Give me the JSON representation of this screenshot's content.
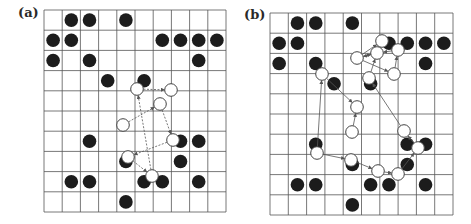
{
  "panels": [
    {
      "label": "(a)",
      "label_pos": [
        18,
        21
      ],
      "grid": {
        "x": 44,
        "y": 10,
        "cols": 10,
        "rows": 10,
        "cw": 18.2,
        "rh": 20.2
      },
      "filled": [
        [
          1,
          0
        ],
        [
          2,
          0
        ],
        [
          4,
          0
        ],
        [
          0,
          1
        ],
        [
          1,
          1
        ],
        [
          6,
          1
        ],
        [
          7,
          1
        ],
        [
          8,
          1
        ],
        [
          9,
          1
        ],
        [
          0,
          2
        ],
        [
          2,
          2
        ],
        [
          8,
          2
        ],
        [
          3,
          3
        ],
        [
          5,
          3
        ],
        [
          2,
          6
        ],
        [
          7,
          6
        ],
        [
          8,
          6
        ],
        [
          4,
          7
        ],
        [
          7,
          7
        ],
        [
          1,
          8
        ],
        [
          2,
          8
        ],
        [
          5,
          8
        ],
        [
          6,
          8
        ],
        [
          8,
          8
        ],
        [
          4,
          9
        ]
      ],
      "open": [
        {
          "id": "A",
          "x": 137,
          "y": 89
        },
        {
          "id": "B",
          "x": 171,
          "y": 90
        },
        {
          "id": "C",
          "x": 160,
          "y": 104
        },
        {
          "id": "D",
          "x": 123,
          "y": 125
        },
        {
          "id": "E",
          "x": 173,
          "y": 140
        },
        {
          "id": "F",
          "x": 128,
          "y": 157
        },
        {
          "id": "G",
          "x": 152,
          "y": 176
        }
      ],
      "arrows": [
        [
          "A",
          "B"
        ],
        [
          "D",
          "C"
        ],
        [
          "C",
          "E"
        ],
        [
          "E",
          "F"
        ],
        [
          "F",
          "G"
        ],
        [
          "G",
          "A"
        ]
      ]
    },
    {
      "label": "(b)",
      "label_pos": [
        244,
        23
      ],
      "grid": {
        "x": 270,
        "y": 13,
        "cols": 10,
        "rows": 10,
        "cw": 18.3,
        "rh": 20.2
      },
      "filled": [
        [
          1,
          0
        ],
        [
          2,
          0
        ],
        [
          4,
          0
        ],
        [
          0,
          1
        ],
        [
          1,
          1
        ],
        [
          6,
          1
        ],
        [
          7,
          1
        ],
        [
          8,
          1
        ],
        [
          9,
          1
        ],
        [
          0,
          2
        ],
        [
          2,
          2
        ],
        [
          8,
          2
        ],
        [
          3,
          3
        ],
        [
          5,
          3
        ],
        [
          2,
          6
        ],
        [
          7,
          6
        ],
        [
          8,
          6
        ],
        [
          4,
          7
        ],
        [
          7,
          7
        ],
        [
          1,
          8
        ],
        [
          2,
          8
        ],
        [
          5,
          8
        ],
        [
          6,
          8
        ],
        [
          8,
          8
        ],
        [
          4,
          9
        ]
      ],
      "open": [
        {
          "id": "P1",
          "x": 382,
          "y": 41
        },
        {
          "id": "P2",
          "x": 377,
          "y": 53
        },
        {
          "id": "P3",
          "x": 357,
          "y": 58
        },
        {
          "id": "P4",
          "x": 398,
          "y": 50
        },
        {
          "id": "P5",
          "x": 394,
          "y": 74
        },
        {
          "id": "P6",
          "x": 369,
          "y": 78
        },
        {
          "id": "Q1",
          "x": 322,
          "y": 74
        },
        {
          "id": "Q2",
          "x": 357,
          "y": 107
        },
        {
          "id": "Q3",
          "x": 352,
          "y": 132
        },
        {
          "id": "Q4",
          "x": 404,
          "y": 131
        },
        {
          "id": "Q5",
          "x": 317,
          "y": 153
        },
        {
          "id": "Q6",
          "x": 351,
          "y": 160
        },
        {
          "id": "Q7",
          "x": 378,
          "y": 171
        },
        {
          "id": "Q8",
          "x": 398,
          "y": 174
        },
        {
          "id": "Q9",
          "x": 418,
          "y": 148
        }
      ],
      "arrows": [
        [
          "P3",
          "P1"
        ],
        [
          "P3",
          "P2"
        ],
        [
          "P2",
          "P3"
        ],
        [
          "P3",
          "P5"
        ],
        [
          "P5",
          "P4"
        ],
        [
          "P4",
          "P2"
        ],
        [
          "P6",
          "P2"
        ],
        [
          "Q5",
          "Q1"
        ],
        [
          "Q1",
          "Q2"
        ],
        [
          "Q3",
          "Q2"
        ],
        [
          "Q4",
          "P6"
        ],
        [
          "Q5",
          "Q6"
        ],
        [
          "Q6",
          "Q7"
        ],
        [
          "Q7",
          "Q8"
        ],
        [
          "Q8",
          "Q9"
        ],
        [
          "Q9",
          "Q4"
        ]
      ]
    }
  ],
  "colors": {
    "grid": "#555555",
    "dot": "#1c1c1c",
    "open_stroke": "#444444",
    "arrow": "#555555"
  }
}
